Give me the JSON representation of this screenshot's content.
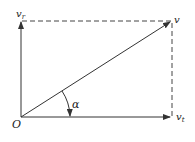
{
  "diagram": {
    "type": "velocity-decomposition",
    "labels": {
      "origin": "O",
      "resultant": "v",
      "radial": "v",
      "radial_sub": "r",
      "tangential": "v",
      "tangential_sub": "t",
      "angle": "α"
    },
    "colors": {
      "line": "#333333",
      "background": "#ffffff"
    }
  }
}
